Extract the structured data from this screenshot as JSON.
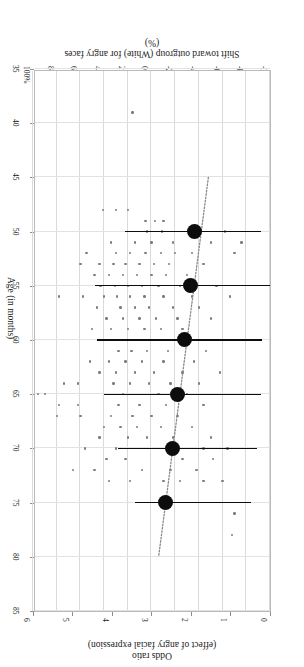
{
  "figure": {
    "top_axis": {
      "line1": "Odds ratio",
      "line2": "(effect of angry facial expression)",
      "ticks": [
        "0",
        "1",
        "2",
        "3",
        "4",
        "5",
        "6"
      ],
      "min": 0,
      "max": 6
    },
    "bottom_axis": {
      "line1": "Shift toward outgroup (White) for angry faces",
      "line2": "(%)",
      "ticks": [
        "-100%",
        "-80%",
        "-60%",
        "-40%",
        "-20%",
        "0%",
        "20%",
        "40%",
        "60%",
        "80%",
        "100%"
      ],
      "min": -100,
      "max": 100
    },
    "right_axis": {
      "title": "Age (in months)",
      "ticks": [
        "35",
        "40",
        "45",
        "50",
        "55",
        "60",
        "65",
        "70",
        "75",
        "80",
        "85"
      ],
      "min": 35,
      "max": 85
    }
  },
  "chart_data": {
    "type": "scatter",
    "title": "",
    "subtitle": "",
    "orientation": "rotated-180",
    "xlabel": "Shift toward outgroup (White) for angry faces (%)",
    "xlabel_secondary": "Odds ratio (effect of angry facial expression)",
    "ylabel": "Age (in months)",
    "xlim": [
      -100,
      100
    ],
    "xlim_secondary": [
      0,
      6
    ],
    "ylim": [
      35,
      85
    ],
    "grid": true,
    "legend": false,
    "xticks": [
      -100,
      -80,
      -60,
      -40,
      -20,
      0,
      20,
      40,
      60,
      80,
      100
    ],
    "xticks_secondary": [
      0,
      1,
      2,
      3,
      4,
      5,
      6
    ],
    "yticks": [
      35,
      40,
      45,
      50,
      55,
      60,
      65,
      70,
      75,
      80,
      85
    ],
    "series": [
      {
        "name": "Binned mean with 95% CI",
        "type": "point-with-errorbar",
        "marker": "filled-circle",
        "color": "#0d0d0d",
        "points": [
          {
            "age": 50,
            "shift_pct": -36,
            "ci_low": -92,
            "ci_high": 22
          },
          {
            "age": 55,
            "shift_pct": -33,
            "ci_low": -100,
            "ci_high": 48
          },
          {
            "age": 60,
            "shift_pct": -28,
            "ci_low": -93,
            "ci_high": 46
          },
          {
            "age": 65,
            "shift_pct": -22,
            "ci_low": -92,
            "ci_high": 40
          },
          {
            "age": 70,
            "shift_pct": -18,
            "ci_low": -89,
            "ci_high": 28
          },
          {
            "age": 75,
            "shift_pct": -12,
            "ci_low": -84,
            "ci_high": 14
          }
        ]
      },
      {
        "name": "Individual participants",
        "type": "scatter",
        "marker": "small-dot",
        "color": "#7d7d7d",
        "points": [
          {
            "age": 39,
            "shift_pct": 16
          },
          {
            "age": 48,
            "shift_pct": 20
          },
          {
            "age": 48,
            "shift_pct": 30
          },
          {
            "age": 48,
            "shift_pct": 41
          },
          {
            "age": 49,
            "shift_pct": -10
          },
          {
            "age": 49,
            "shift_pct": -3
          },
          {
            "age": 49,
            "shift_pct": 5
          },
          {
            "age": 50,
            "shift_pct": -62
          },
          {
            "age": 50,
            "shift_pct": -9
          },
          {
            "age": 50,
            "shift_pct": 4
          },
          {
            "age": 51,
            "shift_pct": -76
          },
          {
            "age": 51,
            "shift_pct": -50
          },
          {
            "age": 51,
            "shift_pct": -18
          },
          {
            "age": 51,
            "shift_pct": 0
          },
          {
            "age": 51,
            "shift_pct": 14
          },
          {
            "age": 51,
            "shift_pct": 34
          },
          {
            "age": 52,
            "shift_pct": -70
          },
          {
            "age": 52,
            "shift_pct": -34
          },
          {
            "age": 52,
            "shift_pct": -20
          },
          {
            "age": 52,
            "shift_pct": -8
          },
          {
            "age": 52,
            "shift_pct": 5
          },
          {
            "age": 52,
            "shift_pct": 18
          },
          {
            "age": 52,
            "shift_pct": 30
          },
          {
            "age": 52,
            "shift_pct": 55
          },
          {
            "age": 53,
            "shift_pct": -44
          },
          {
            "age": 53,
            "shift_pct": -15
          },
          {
            "age": 53,
            "shift_pct": -2
          },
          {
            "age": 53,
            "shift_pct": 10
          },
          {
            "age": 53,
            "shift_pct": 22
          },
          {
            "age": 53,
            "shift_pct": 32
          },
          {
            "age": 53,
            "shift_pct": 44
          },
          {
            "age": 53,
            "shift_pct": 60
          },
          {
            "age": 54,
            "shift_pct": -30
          },
          {
            "age": 54,
            "shift_pct": -12
          },
          {
            "age": 54,
            "shift_pct": 0
          },
          {
            "age": 54,
            "shift_pct": 12
          },
          {
            "age": 54,
            "shift_pct": 24
          },
          {
            "age": 54,
            "shift_pct": 36
          },
          {
            "age": 54,
            "shift_pct": 48
          },
          {
            "age": 55,
            "shift_pct": -55
          },
          {
            "age": 55,
            "shift_pct": -24
          },
          {
            "age": 55,
            "shift_pct": -6
          },
          {
            "age": 55,
            "shift_pct": 8
          },
          {
            "age": 55,
            "shift_pct": 20
          },
          {
            "age": 55,
            "shift_pct": 31
          },
          {
            "age": 55,
            "shift_pct": 43
          },
          {
            "age": 56,
            "shift_pct": -66
          },
          {
            "age": 56,
            "shift_pct": -34
          },
          {
            "age": 56,
            "shift_pct": -10
          },
          {
            "age": 56,
            "shift_pct": 6
          },
          {
            "age": 56,
            "shift_pct": 18
          },
          {
            "age": 56,
            "shift_pct": 29
          },
          {
            "age": 56,
            "shift_pct": 40
          },
          {
            "age": 56,
            "shift_pct": 58
          },
          {
            "age": 56,
            "shift_pct": 78
          },
          {
            "age": 57,
            "shift_pct": -40
          },
          {
            "age": 57,
            "shift_pct": -18
          },
          {
            "age": 57,
            "shift_pct": 2
          },
          {
            "age": 57,
            "shift_pct": 14
          },
          {
            "age": 57,
            "shift_pct": 26
          },
          {
            "age": 57,
            "shift_pct": 46
          },
          {
            "age": 58,
            "shift_pct": -50
          },
          {
            "age": 58,
            "shift_pct": -22
          },
          {
            "age": 58,
            "shift_pct": -4
          },
          {
            "age": 58,
            "shift_pct": 10
          },
          {
            "age": 58,
            "shift_pct": 24
          },
          {
            "age": 58,
            "shift_pct": 38
          },
          {
            "age": 59,
            "shift_pct": -26
          },
          {
            "age": 59,
            "shift_pct": -8
          },
          {
            "age": 59,
            "shift_pct": 6
          },
          {
            "age": 59,
            "shift_pct": 20
          },
          {
            "age": 59,
            "shift_pct": 34
          },
          {
            "age": 59,
            "shift_pct": 50
          },
          {
            "age": 60,
            "shift_pct": -58
          },
          {
            "age": 60,
            "shift_pct": -30
          },
          {
            "age": 60,
            "shift_pct": 16
          },
          {
            "age": 60,
            "shift_pct": 33
          },
          {
            "age": 60,
            "shift_pct": 41
          },
          {
            "age": 61,
            "shift_pct": -46
          },
          {
            "age": 61,
            "shift_pct": -14
          },
          {
            "age": 61,
            "shift_pct": 4
          },
          {
            "age": 61,
            "shift_pct": 17
          },
          {
            "age": 61,
            "shift_pct": 28
          },
          {
            "age": 62,
            "shift_pct": -36
          },
          {
            "age": 62,
            "shift_pct": -10
          },
          {
            "age": 62,
            "shift_pct": 8
          },
          {
            "age": 62,
            "shift_pct": 22
          },
          {
            "age": 62,
            "shift_pct": 36
          },
          {
            "age": 62,
            "shift_pct": 52
          },
          {
            "age": 63,
            "shift_pct": -58
          },
          {
            "age": 63,
            "shift_pct": -26
          },
          {
            "age": 63,
            "shift_pct": -2
          },
          {
            "age": 63,
            "shift_pct": 14
          },
          {
            "age": 63,
            "shift_pct": 30
          },
          {
            "age": 63,
            "shift_pct": 44
          },
          {
            "age": 64,
            "shift_pct": -40
          },
          {
            "age": 64,
            "shift_pct": -16
          },
          {
            "age": 64,
            "shift_pct": 2
          },
          {
            "age": 64,
            "shift_pct": 18
          },
          {
            "age": 64,
            "shift_pct": 32
          },
          {
            "age": 64,
            "shift_pct": 62
          },
          {
            "age": 64,
            "shift_pct": 74
          },
          {
            "age": 65,
            "shift_pct": -30
          },
          {
            "age": 65,
            "shift_pct": -6
          },
          {
            "age": 65,
            "shift_pct": 24
          },
          {
            "age": 65,
            "shift_pct": 90
          },
          {
            "age": 65,
            "shift_pct": 96
          },
          {
            "age": 66,
            "shift_pct": -44
          },
          {
            "age": 66,
            "shift_pct": -12
          },
          {
            "age": 66,
            "shift_pct": 10
          },
          {
            "age": 66,
            "shift_pct": 28
          },
          {
            "age": 66,
            "shift_pct": 62
          },
          {
            "age": 66,
            "shift_pct": 78
          },
          {
            "age": 67,
            "shift_pct": -22
          },
          {
            "age": 67,
            "shift_pct": 0
          },
          {
            "age": 67,
            "shift_pct": 16
          },
          {
            "age": 67,
            "shift_pct": 34
          },
          {
            "age": 67,
            "shift_pct": 60
          },
          {
            "age": 67,
            "shift_pct": 80
          },
          {
            "age": 68,
            "shift_pct": -34
          },
          {
            "age": 68,
            "shift_pct": -8
          },
          {
            "age": 68,
            "shift_pct": 12
          },
          {
            "age": 68,
            "shift_pct": 26
          },
          {
            "age": 68,
            "shift_pct": 40
          },
          {
            "age": 69,
            "shift_pct": -50
          },
          {
            "age": 69,
            "shift_pct": -18
          },
          {
            "age": 69,
            "shift_pct": 4
          },
          {
            "age": 69,
            "shift_pct": 20
          },
          {
            "age": 69,
            "shift_pct": 44
          },
          {
            "age": 70,
            "shift_pct": -64
          },
          {
            "age": 70,
            "shift_pct": -44
          },
          {
            "age": 70,
            "shift_pct": 30
          },
          {
            "age": 70,
            "shift_pct": 56
          },
          {
            "age": 71,
            "shift_pct": -52
          },
          {
            "age": 71,
            "shift_pct": -26
          },
          {
            "age": 71,
            "shift_pct": 22
          },
          {
            "age": 71,
            "shift_pct": 38
          },
          {
            "age": 72,
            "shift_pct": -38
          },
          {
            "age": 72,
            "shift_pct": -16
          },
          {
            "age": 72,
            "shift_pct": 8
          },
          {
            "age": 72,
            "shift_pct": 48
          },
          {
            "age": 72,
            "shift_pct": 66
          },
          {
            "age": 73,
            "shift_pct": -60
          },
          {
            "age": 73,
            "shift_pct": -44
          },
          {
            "age": 73,
            "shift_pct": -24
          },
          {
            "age": 73,
            "shift_pct": -10
          },
          {
            "age": 73,
            "shift_pct": 18
          },
          {
            "age": 73,
            "shift_pct": 36
          },
          {
            "age": 76,
            "shift_pct": -70
          },
          {
            "age": 78,
            "shift_pct": -68
          }
        ]
      },
      {
        "name": "Fitted trend",
        "type": "line",
        "style": "dotted",
        "color": "#8a8a8a",
        "points": [
          {
            "age": 45,
            "shift_pct": -48
          },
          {
            "age": 80,
            "shift_pct": -6
          }
        ]
      }
    ]
  }
}
